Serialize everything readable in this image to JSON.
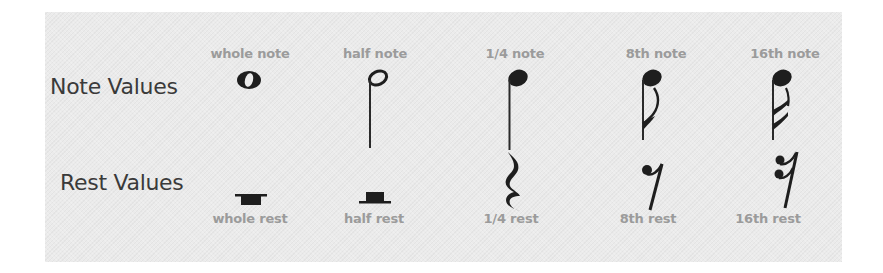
{
  "diagram": {
    "rows": [
      {
        "title": "Note Values",
        "items": [
          {
            "label": "whole note",
            "symbol": "whole-note-icon"
          },
          {
            "label": "half note",
            "symbol": "half-note-icon"
          },
          {
            "label": "1/4 note",
            "symbol": "quarter-note-icon"
          },
          {
            "label": "8th note",
            "symbol": "eighth-note-icon"
          },
          {
            "label": "16th note",
            "symbol": "sixteenth-note-icon"
          }
        ]
      },
      {
        "title": "Rest Values",
        "items": [
          {
            "label": "whole rest",
            "symbol": "whole-rest-icon"
          },
          {
            "label": "half rest",
            "symbol": "half-rest-icon"
          },
          {
            "label": "1/4 rest",
            "symbol": "quarter-rest-icon"
          },
          {
            "label": "8th rest",
            "symbol": "eighth-rest-icon"
          },
          {
            "label": "16th rest",
            "symbol": "sixteenth-rest-icon"
          }
        ]
      }
    ],
    "colors": {
      "panel": "#ebebeb",
      "title_text": "#3a3a3a",
      "label_text": "#9b9b9b",
      "glyph": "#1e1e1e"
    }
  }
}
